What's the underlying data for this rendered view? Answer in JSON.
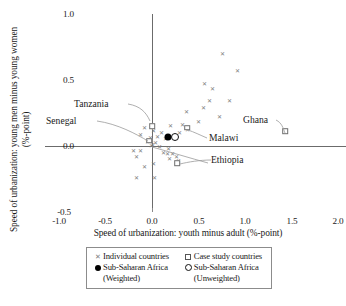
{
  "chart_data": {
    "type": "scatter",
    "title": "",
    "xlabel": "Speed of urbanization: youth minus adult (%-point)",
    "ylabel": "Speed of urbanization: young men minus young women (%-point)",
    "xlim": [
      -1.0,
      2.0
    ],
    "ylim": [
      -0.5,
      1.0
    ],
    "xticks": [
      "-1.0",
      "-0.5",
      "0.0",
      "0.5",
      "1.0",
      "1.5",
      "2.0"
    ],
    "xtick_values": [
      -1.0,
      -0.5,
      0.0,
      0.5,
      1.0,
      1.5,
      2.0
    ],
    "yticks": [
      "1.0",
      "0.5",
      "0.0",
      "-0.5"
    ],
    "ytick_values": [
      1.0,
      0.5,
      0.0,
      -0.5
    ],
    "grid": false,
    "legend_position": "below-axis",
    "series": [
      {
        "name": "Individual countries",
        "marker": "x",
        "points": [
          [
            0.76,
            0.7
          ],
          [
            0.92,
            0.57
          ],
          [
            0.56,
            0.47
          ],
          [
            0.65,
            0.43
          ],
          [
            0.62,
            0.34
          ],
          [
            0.83,
            0.34
          ],
          [
            0.55,
            0.29
          ],
          [
            0.37,
            0.26
          ],
          [
            0.73,
            0.22
          ],
          [
            0.5,
            0.18
          ],
          [
            0.33,
            0.16
          ],
          [
            0.2,
            0.15
          ],
          [
            -0.08,
            0.14
          ],
          [
            0.02,
            0.11
          ],
          [
            0.1,
            0.1
          ],
          [
            -0.12,
            0.08
          ],
          [
            0.06,
            0.07
          ],
          [
            -0.02,
            0.06
          ],
          [
            0.14,
            0.05
          ],
          [
            0.38,
            0.12
          ],
          [
            0.3,
            0.1
          ],
          [
            -0.05,
            0.03
          ],
          [
            0.04,
            0.02
          ],
          [
            0.01,
            0.01
          ],
          [
            -0.01,
            0.0
          ],
          [
            0.08,
            -0.01
          ],
          [
            0.18,
            -0.02
          ],
          [
            -0.2,
            -0.04
          ],
          [
            -0.12,
            -0.04
          ],
          [
            -0.17,
            -0.08
          ],
          [
            0.12,
            -0.05
          ],
          [
            0.17,
            -0.06
          ],
          [
            0.22,
            -0.06
          ],
          [
            0.26,
            -0.08
          ],
          [
            0.19,
            -0.1
          ],
          [
            0.28,
            -0.11
          ],
          [
            -0.08,
            -0.16
          ],
          [
            0.02,
            -0.14
          ],
          [
            -0.17,
            -0.24
          ],
          [
            0.03,
            -0.24
          ],
          [
            1.42,
            0.12
          ]
        ]
      },
      {
        "name": "Case study countries",
        "marker": "square",
        "points": [
          [
            0.0,
            0.15
          ],
          [
            0.38,
            0.14
          ],
          [
            1.43,
            0.11
          ],
          [
            0.27,
            -0.13
          ],
          [
            -0.03,
            0.04
          ]
        ]
      },
      {
        "name": "Sub-Saharan Africa (Weighted)",
        "marker": "filled-circle",
        "points": [
          [
            0.17,
            0.07
          ]
        ]
      },
      {
        "name": "Sub-Saharan Africa (Unweighted)",
        "marker": "open-circle",
        "points": [
          [
            0.25,
            0.07
          ]
        ]
      }
    ],
    "annotations": [
      {
        "label": "Tanzania",
        "x": -0.62,
        "y": 0.44
      },
      {
        "label": "Senegal",
        "x": -0.88,
        "y": 0.19
      },
      {
        "label": "Ghana",
        "x": 0.87,
        "y": 0.2
      },
      {
        "label": "Malawi",
        "x": 0.48,
        "y": 0.03
      },
      {
        "label": "Ethiopia",
        "x": 0.58,
        "y": -0.1
      }
    ]
  },
  "axes": {
    "x_label": "Speed of urbanization: youth minus adult (%-point)",
    "y_label": "Speed of urbanization: young men minus young women (%-point)",
    "x_ticks": [
      "-1.0",
      "-0.5",
      "0.0",
      "0.5",
      "1.0",
      "1.5",
      "2.0"
    ],
    "y_ticks": [
      "1.0",
      "0.5",
      "0.0",
      "-0.5"
    ]
  },
  "annotations": {
    "tanzania": "Tanzania",
    "senegal": "Senegal",
    "ghana": "Ghana",
    "malawi": "Malawi",
    "ethiopia": "Ethiopia"
  },
  "legend": {
    "individual": "Individual countries",
    "case_study": "Case study countries",
    "ssa_weighted": "Sub-Saharan Africa",
    "ssa_weighted_sub": "(Weighted)",
    "ssa_unweighted": "Sub-Saharan Africa",
    "ssa_unweighted_sub": "(Unweighted)"
  },
  "colors": {
    "marker_x": "#7d7d7d",
    "marker_square_stroke": "#6e6e6e",
    "marker_filled": "#000000",
    "axis": "#6b6b6b",
    "text": "#1a1a1a",
    "background": "#ffffff"
  }
}
